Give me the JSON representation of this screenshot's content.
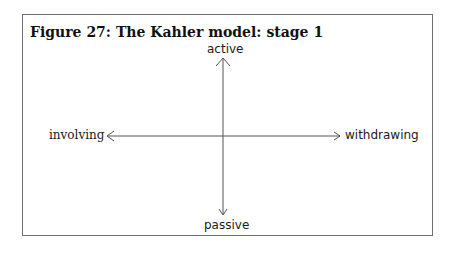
{
  "figure": {
    "title": "Figure 27: The Kahler model: stage 1",
    "axes": {
      "top": "active",
      "bottom": "passive",
      "left": "involving",
      "right": "withdrawing"
    },
    "colors": {
      "frame": "#6e6e6e",
      "arrow": "#555555",
      "text": "#1a1a1a"
    }
  }
}
